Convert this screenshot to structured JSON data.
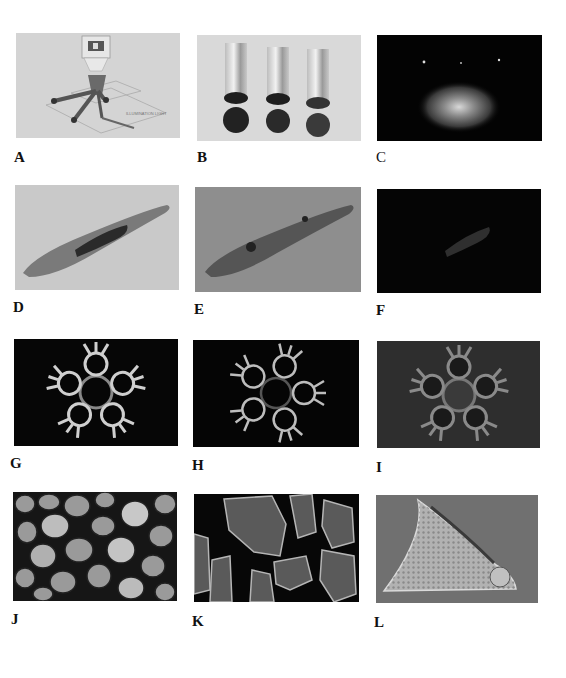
{
  "figure": {
    "panels": [
      {
        "id": "A",
        "label": "A",
        "subject": "optical-apparatus-diagram",
        "background": "#d6d6d6",
        "inset_text": "ILLUMINATION LIGHT"
      },
      {
        "id": "B",
        "label": "B",
        "subject": "three-test-tubes",
        "background": "#d8d8d8"
      },
      {
        "id": "C",
        "label": "C",
        "subject": "glowing-spot-dark-field",
        "background": "#030303"
      },
      {
        "id": "D",
        "label": "D",
        "subject": "elongated-organism-bright-field",
        "background": "#c8c8c8"
      },
      {
        "id": "E",
        "label": "E",
        "subject": "elongated-organism-gray-field",
        "background": "#8c8c8c"
      },
      {
        "id": "F",
        "label": "F",
        "subject": "elongated-organism-dark-field",
        "background": "#050505"
      },
      {
        "id": "G",
        "label": "G",
        "subject": "radial-colony-dark-field",
        "background": "#060606"
      },
      {
        "id": "H",
        "label": "H",
        "subject": "radial-colony-dark-field-2",
        "background": "#050505"
      },
      {
        "id": "I",
        "label": "I",
        "subject": "radial-colony-gray-field",
        "background": "#2e2e2e"
      },
      {
        "id": "J",
        "label": "J",
        "subject": "packed-round-grains",
        "background": "#1e1e1e"
      },
      {
        "id": "K",
        "label": "K",
        "subject": "angular-crystal-fragments",
        "background": "#070707"
      },
      {
        "id": "L",
        "label": "L",
        "subject": "triangular-diatom-shell",
        "background": "#6f6f6f"
      }
    ]
  }
}
